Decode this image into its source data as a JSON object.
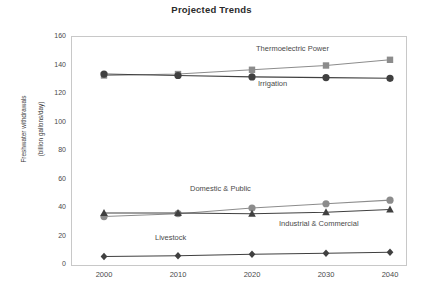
{
  "chart_data": {
    "type": "line",
    "title": "Projected Trends",
    "xlabel": "",
    "ylabel": "Freshwater withdrawals\n(billion gallons/day)",
    "ylabel_line1": "Freshwater withdrawals",
    "ylabel_line2": "(billion gallons/day)",
    "categories": [
      "2000",
      "2010",
      "2020",
      "2030",
      "2040"
    ],
    "x": [
      2000,
      2010,
      2020,
      2030,
      2040
    ],
    "xlim": [
      1995,
      2045
    ],
    "ylim": [
      0,
      160
    ],
    "yticks": [
      "0",
      "20",
      "40",
      "60",
      "80",
      "100",
      "120",
      "140",
      "160"
    ],
    "ytick_values": [
      0,
      20,
      40,
      60,
      80,
      100,
      120,
      140,
      160
    ],
    "grid": false,
    "legend": "inline-annotations",
    "series": [
      {
        "name": "Thermoelectric Power",
        "values": [
          133,
          134,
          137,
          140,
          144
        ],
        "marker": "square",
        "color": "#8c8c8c",
        "label_x": 256,
        "label_y": 44
      },
      {
        "name": "Irrigation",
        "values": [
          134,
          133,
          132,
          131.5,
          131
        ],
        "marker": "circle",
        "color": "#404040",
        "label_x": 258,
        "label_y": 79
      },
      {
        "name": "Domestic & Public",
        "values": [
          34,
          36,
          40,
          43,
          45.5
        ],
        "marker": "circle",
        "color": "#8c8c8c",
        "label_x": 190,
        "label_y": 184
      },
      {
        "name": "Industrial & Commercial",
        "values": [
          36.5,
          36.5,
          36,
          37,
          39
        ],
        "marker": "triangle",
        "color": "#404040",
        "label_x": 279,
        "label_y": 219
      },
      {
        "name": "Livestock",
        "values": [
          6,
          6.5,
          7.5,
          8.2,
          9
        ],
        "marker": "diamond",
        "color": "#404040",
        "label_x": 155,
        "label_y": 233
      }
    ]
  },
  "colors": {
    "dark": "#404040",
    "gray": "#8c8c8c",
    "axis": "#bdbdbd",
    "text": "#4a4a4a",
    "background": "#ffffff"
  }
}
